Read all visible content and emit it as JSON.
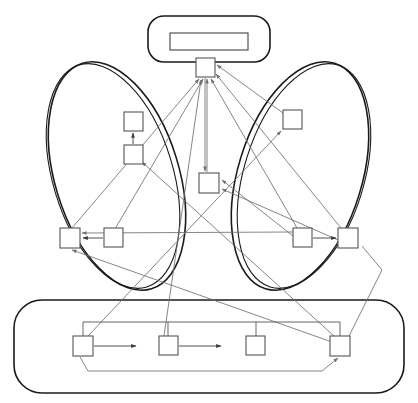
{
  "diagram": {
    "title": "",
    "canvas": {
      "width": 418,
      "height": 403
    },
    "colors": {
      "background": "#ffffff",
      "group_stroke": "#1a1a1a",
      "node_stroke": "#555555",
      "edge_stroke": "#707070",
      "edge_dark_stroke": "#3c3c3c"
    },
    "groups": [
      {
        "id": "top-group",
        "shape": "rounded-rectangle",
        "label": "",
        "x": 148,
        "y": 16,
        "width": 122,
        "height": 46,
        "rx": 16,
        "inner_bar": {
          "label": "",
          "x": 170,
          "y": 33,
          "width": 78,
          "height": 17
        }
      },
      {
        "id": "left-group",
        "shape": "ellipse",
        "label": "",
        "cx": 117,
        "cy": 176,
        "rx": 62,
        "ry": 118,
        "rotate": -17,
        "double_outline": true
      },
      {
        "id": "right-group",
        "shape": "ellipse",
        "label": "",
        "cx": 300,
        "cy": 176,
        "rx": 62,
        "ry": 118,
        "rotate": 17,
        "double_outline": true
      },
      {
        "id": "bottom-group",
        "shape": "rounded-rectangle",
        "label": "",
        "x": 14,
        "y": 300,
        "width": 390,
        "height": 93,
        "rx": 28
      }
    ],
    "nodes": [
      {
        "id": "n-top",
        "label": "",
        "group": "top-group",
        "x": 196,
        "y": 58,
        "width": 19,
        "height": 19
      },
      {
        "id": "n-center",
        "label": "",
        "group": "top-group",
        "x": 199,
        "y": 173,
        "width": 20,
        "height": 20
      },
      {
        "id": "n-left-up-a",
        "label": "",
        "group": "left-group",
        "x": 124,
        "y": 112,
        "width": 19,
        "height": 19
      },
      {
        "id": "n-left-up-b",
        "label": "",
        "group": "left-group",
        "x": 124,
        "y": 145,
        "width": 19,
        "height": 19
      },
      {
        "id": "n-left-low-a",
        "label": "",
        "group": "left-group",
        "x": 60,
        "y": 228,
        "width": 20,
        "height": 20
      },
      {
        "id": "n-left-low-b",
        "label": "",
        "group": "left-group",
        "x": 104,
        "y": 228,
        "width": 19,
        "height": 19
      },
      {
        "id": "n-right-up",
        "label": "",
        "group": "right-group",
        "x": 283,
        "y": 110,
        "width": 19,
        "height": 19
      },
      {
        "id": "n-right-low-a",
        "label": "",
        "group": "right-group",
        "x": 293,
        "y": 228,
        "width": 19,
        "height": 19
      },
      {
        "id": "n-right-low-b",
        "label": "",
        "group": "right-group",
        "x": 338,
        "y": 228,
        "width": 20,
        "height": 20
      },
      {
        "id": "n-bot-1",
        "label": "",
        "group": "bottom-group",
        "x": 73,
        "y": 336,
        "width": 20,
        "height": 20
      },
      {
        "id": "n-bot-2",
        "label": "",
        "group": "bottom-group",
        "x": 159,
        "y": 336,
        "width": 19,
        "height": 19
      },
      {
        "id": "n-bot-3",
        "label": "",
        "group": "bottom-group",
        "x": 246,
        "y": 336,
        "width": 19,
        "height": 19
      },
      {
        "id": "n-bot-4",
        "label": "",
        "group": "bottom-group",
        "x": 330,
        "y": 336,
        "width": 20,
        "height": 20
      }
    ],
    "edges": [
      {
        "id": "e1",
        "from": "n-left-up-b",
        "to": "n-left-up-a",
        "label": "",
        "arrow": true
      },
      {
        "id": "e2",
        "from": "n-left-low-b",
        "to": "n-left-low-a",
        "label": "",
        "arrow": true
      },
      {
        "id": "e3",
        "from": "n-right-low-a",
        "to": "n-right-low-b",
        "label": "",
        "arrow": true
      },
      {
        "id": "e4",
        "from": "n-bot-1",
        "to": "n-bot-2",
        "label": "",
        "arrow": true
      },
      {
        "id": "e5",
        "from": "n-bot-2",
        "to": "n-bot-3",
        "label": "",
        "arrow": true
      },
      {
        "id": "e6",
        "from": "n-left-low-a",
        "to": "n-top",
        "label": "",
        "arrow": true
      },
      {
        "id": "e7",
        "from": "n-left-low-b",
        "to": "n-top",
        "label": "",
        "arrow": true
      },
      {
        "id": "e8",
        "from": "n-center",
        "to": "n-top",
        "label": "",
        "arrow": true
      },
      {
        "id": "e9",
        "from": "n-right-low-a",
        "to": "n-top",
        "label": "",
        "arrow": true
      },
      {
        "id": "e10",
        "from": "n-right-low-b",
        "to": "n-top",
        "label": "",
        "arrow": true
      },
      {
        "id": "e11",
        "from": "n-right-up",
        "to": "n-top",
        "label": "",
        "arrow": true
      },
      {
        "id": "e12",
        "from": "n-bot-2",
        "to": "n-top",
        "label": "",
        "arrow": true
      },
      {
        "id": "e13",
        "from": "n-top",
        "to": "n-center",
        "label": "",
        "arrow": true
      },
      {
        "id": "e14",
        "from": "n-right-low-a",
        "to": "n-center",
        "label": "",
        "arrow": true
      },
      {
        "id": "e15",
        "from": "n-right-low-b",
        "to": "n-center",
        "label": "",
        "arrow": true
      },
      {
        "id": "e16",
        "from": "n-bot-1",
        "to": "n-right-up",
        "label": "",
        "arrow": true
      },
      {
        "id": "e17",
        "from": "n-bot-4",
        "to": "n-left-up-b",
        "label": "",
        "arrow": true
      },
      {
        "id": "e18",
        "from": "n-right-low-a",
        "to": "n-left-low-a",
        "label": "",
        "arrow": true
      },
      {
        "id": "e19",
        "from": "n-bot-4",
        "to": "n-left-low-a",
        "label": "",
        "arrow": true
      },
      {
        "id": "e20",
        "from": "n-bot-1",
        "to": "n-bot-4",
        "label": "",
        "arrow": true
      },
      {
        "id": "e21",
        "from": "n-bot-4",
        "to": "n-right-low-b",
        "label": "",
        "arrow": false
      }
    ],
    "bus": {
      "id": "bottom-bus",
      "label": "",
      "y": 322,
      "x_start": 83,
      "x_end": 340,
      "taps": [
        83,
        168,
        256,
        340
      ]
    }
  }
}
